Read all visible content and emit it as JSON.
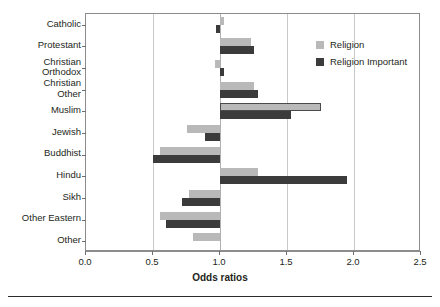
{
  "chart_data": {
    "type": "bar",
    "orientation": "horizontal",
    "title": "",
    "xlabel": "Odds ratios",
    "ylabel": "Religion",
    "xlim": [
      0.0,
      2.5
    ],
    "xticks": [
      "0.0",
      "0.5",
      "1.0",
      "1.5",
      "2.0",
      "2.5"
    ],
    "xtick_values": [
      0.0,
      0.5,
      1.0,
      1.5,
      2.0,
      2.5
    ],
    "reference_line": 1.0,
    "grid": "vertical",
    "legend_position": "upper right",
    "categories": [
      "Catholic",
      "Protestant",
      "Christian\nOrthodox",
      "Christian\nOther",
      "Muslim",
      "Jewish",
      "Buddhist",
      "Hindu",
      "Sikh",
      "Other Eastern",
      "Other"
    ],
    "series": [
      {
        "name": "Religion",
        "color": "#b9b9b9",
        "values": [
          1.03,
          1.23,
          0.96,
          1.25,
          1.75,
          0.75,
          0.55,
          1.28,
          0.77,
          0.55,
          0.8
        ]
      },
      {
        "name": "Religion Important",
        "color": "#3b3b3b",
        "values": [
          0.97,
          1.25,
          1.03,
          1.28,
          1.53,
          0.89,
          0.5,
          1.95,
          0.72,
          0.6,
          null
        ]
      }
    ]
  },
  "legend": {
    "items": [
      {
        "label": "Religion",
        "swatch": "light"
      },
      {
        "label": "Religion Important",
        "swatch": "dark"
      }
    ]
  }
}
